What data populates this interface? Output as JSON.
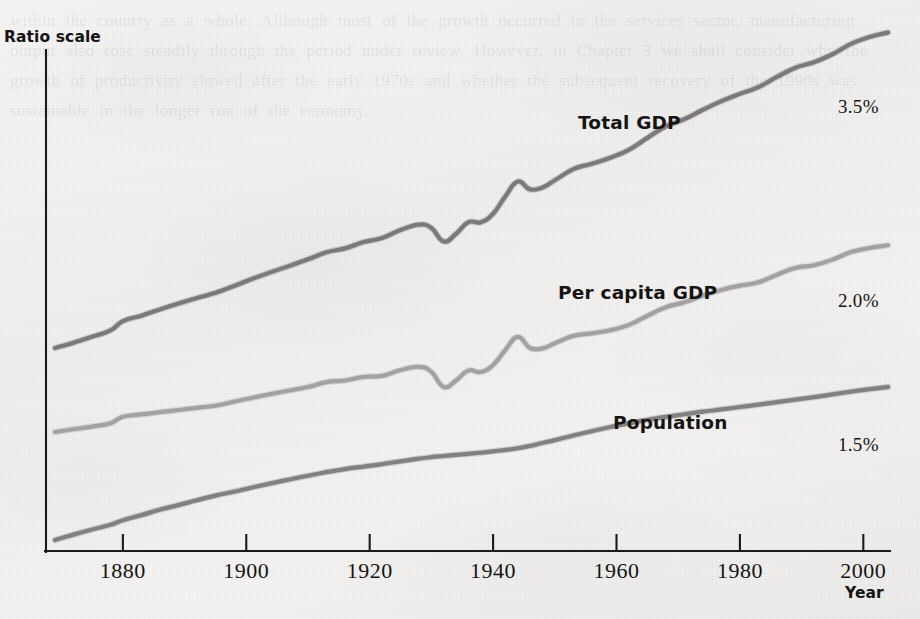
{
  "axes": {
    "y_title": "Ratio scale",
    "x_title": "Year",
    "x_ticks": [
      {
        "label": "1880",
        "value": 1880
      },
      {
        "label": "1900",
        "value": 1900
      },
      {
        "label": "1920",
        "value": 1920
      },
      {
        "label": "1940",
        "value": 1940
      },
      {
        "label": "1960",
        "value": 1960
      },
      {
        "label": "1980",
        "value": 1980
      },
      {
        "label": "2000",
        "value": 2000
      }
    ]
  },
  "series_labels": {
    "total_gdp": "Total GDP",
    "per_capita_gdp": "Per capita GDP",
    "population": "Population"
  },
  "rate_labels": {
    "total_gdp": "3.5%",
    "per_capita_gdp": "2.0%",
    "population": "1.5%"
  },
  "colors": {
    "total_gdp": "#7b7a78",
    "per_capita_gdp": "#a3a2a0",
    "population": "#82817f",
    "axis": "#1a1a1a",
    "text": "#141414",
    "paper": "#f2f1ef"
  },
  "bleed_text": "within the country as a whole. Although most of the growth occurred in the services sector, manufacturing output also rose steadily through the period under review. However, in Chapter 3 we shall consider why the growth of productivity slowed after the early 1970s and whether the subsequent recovery of the 1990s was sustainable in the longer run of the economy.",
  "chart_data": {
    "type": "line",
    "title": "",
    "xlabel": "Year",
    "ylabel": "Ratio scale",
    "xlim": [
      1869,
      2004
    ],
    "ylog": true,
    "grid": false,
    "legend": "inline-annotations",
    "annotations": [
      {
        "text": "Total GDP",
        "x": 1948,
        "series": "total_gdp"
      },
      {
        "text": "Per capita GDP",
        "x": 1945,
        "series": "per_capita_gdp"
      },
      {
        "text": "Population",
        "x": 1955,
        "series": "population"
      },
      {
        "text": "3.5%",
        "x": 2000,
        "note": "average annual growth rate of total GDP"
      },
      {
        "text": "2.0%",
        "x": 2000,
        "note": "average annual growth rate of per capita GDP"
      },
      {
        "text": "1.5%",
        "x": 2000,
        "note": "average annual growth rate of population"
      }
    ],
    "series": [
      {
        "name": "Total GDP",
        "growth_rate_pct": 3.5,
        "color": "#7b7a78",
        "x": [
          1869,
          1872,
          1875,
          1878,
          1880,
          1883,
          1886,
          1889,
          1892,
          1895,
          1898,
          1901,
          1904,
          1907,
          1910,
          1913,
          1916,
          1919,
          1922,
          1925,
          1928,
          1930,
          1932,
          1934,
          1936,
          1938,
          1940,
          1942,
          1944,
          1946,
          1948,
          1950,
          1953,
          1956,
          1959,
          1962,
          1965,
          1968,
          1971,
          1974,
          1977,
          1980,
          1983,
          1986,
          1989,
          1992,
          1995,
          1998,
          2001,
          2004
        ],
        "y_index": [
          100,
          106,
          113,
          121,
          134,
          142,
          152,
          162,
          172,
          182,
          196,
          212,
          228,
          244,
          262,
          283,
          295,
          316,
          330,
          360,
          382,
          368,
          318,
          346,
          392,
          392,
          430,
          520,
          610,
          560,
          572,
          618,
          698,
          740,
          790,
          860,
          980,
          1110,
          1200,
          1330,
          1460,
          1580,
          1700,
          1900,
          2100,
          2230,
          2430,
          2720,
          2930,
          3080
        ]
      },
      {
        "name": "Per capita GDP",
        "growth_rate_pct": 2.0,
        "color": "#a3a2a0",
        "x": [
          1869,
          1872,
          1875,
          1878,
          1880,
          1883,
          1886,
          1889,
          1892,
          1895,
          1898,
          1901,
          1904,
          1907,
          1910,
          1913,
          1916,
          1919,
          1922,
          1925,
          1928,
          1930,
          1932,
          1934,
          1936,
          1938,
          1940,
          1942,
          1944,
          1946,
          1948,
          1950,
          1953,
          1956,
          1959,
          1962,
          1965,
          1968,
          1971,
          1974,
          1977,
          1980,
          1983,
          1986,
          1989,
          1992,
          1995,
          1998,
          2001,
          2004
        ],
        "y_index": [
          100,
          103,
          106,
          110,
          118,
          121,
          124,
          127,
          130,
          133,
          139,
          145,
          151,
          157,
          163,
          172,
          175,
          182,
          184,
          196,
          203,
          192,
          163,
          175,
          195,
          192,
          207,
          244,
          281,
          249,
          248,
          262,
          284,
          292,
          302,
          320,
          353,
          388,
          409,
          440,
          468,
          490,
          508,
          552,
          594,
          612,
          650,
          706,
          738,
          760
        ]
      },
      {
        "name": "Population",
        "growth_rate_pct": 1.5,
        "color": "#82817f",
        "x": [
          1869,
          1872,
          1875,
          1878,
          1880,
          1883,
          1886,
          1889,
          1892,
          1895,
          1898,
          1901,
          1904,
          1907,
          1910,
          1913,
          1916,
          1919,
          1922,
          1925,
          1928,
          1930,
          1932,
          1934,
          1936,
          1938,
          1940,
          1942,
          1944,
          1946,
          1948,
          1950,
          1953,
          1956,
          1959,
          1962,
          1965,
          1968,
          1971,
          1974,
          1977,
          1980,
          1983,
          1986,
          1989,
          1992,
          1995,
          1998,
          2001,
          2004
        ],
        "y_index": [
          100,
          106,
          112,
          118,
          124,
          131,
          139,
          146,
          154,
          162,
          169,
          177,
          185,
          193,
          201,
          209,
          216,
          222,
          228,
          235,
          242,
          246,
          249,
          252,
          255,
          258,
          262,
          266,
          271,
          278,
          287,
          296,
          311,
          326,
          341,
          355,
          369,
          381,
          392,
          403,
          413,
          424,
          435,
          447,
          459,
          472,
          486,
          501,
          515,
          527
        ]
      }
    ]
  }
}
